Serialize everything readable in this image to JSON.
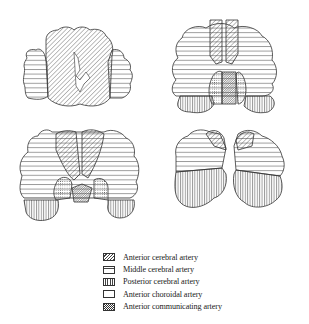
{
  "figure": {
    "panels": [
      {
        "name": "section-1",
        "position": "top-left",
        "territories": [
          "Anterior cerebral artery",
          "Middle cerebral artery"
        ]
      },
      {
        "name": "section-2",
        "position": "top-right",
        "territories": [
          "Anterior cerebral artery",
          "Middle cerebral artery",
          "Posterior cerebral artery",
          "Anterior choroidal artery",
          "Anterior communicating artery"
        ]
      },
      {
        "name": "section-3",
        "position": "bottom-left",
        "territories": [
          "Anterior cerebral artery",
          "Middle cerebral artery",
          "Posterior cerebral artery",
          "Anterior choroidal artery",
          "Anterior communicating artery"
        ]
      },
      {
        "name": "section-4",
        "position": "bottom-right",
        "territories": [
          "Anterior cerebral artery",
          "Middle cerebral artery",
          "Posterior cerebral artery"
        ]
      }
    ]
  },
  "legend": {
    "items": [
      {
        "label": "Anterior cerebral artery",
        "pattern": "diagonal-hatch"
      },
      {
        "label": "Middle cerebral artery",
        "pattern": "horizontal-lines"
      },
      {
        "label": "Posterior cerebral artery",
        "pattern": "vertical-lines"
      },
      {
        "label": "Anterior choroidal artery",
        "pattern": "stipple"
      },
      {
        "label": "Anterior communicating artery",
        "pattern": "dense-diagonal-hatch"
      }
    ]
  },
  "colors": {
    "ink": "#333333",
    "background": "#ffffff"
  }
}
